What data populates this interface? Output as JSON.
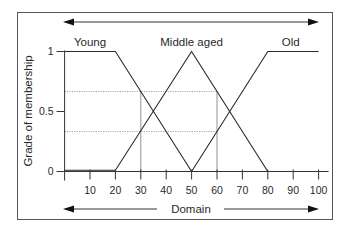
{
  "chart_data": {
    "type": "line",
    "title": "",
    "xlabel": "Domain",
    "ylabel": "Grade of membership",
    "xlim": [
      0,
      100
    ],
    "ylim": [
      0,
      1
    ],
    "grid": false,
    "legend": "inline labels above each membership function",
    "xticks": [
      10,
      20,
      30,
      40,
      50,
      60,
      70,
      80,
      90,
      100
    ],
    "xtick_labels": [
      "10",
      "20",
      "30",
      "40",
      "50",
      "60",
      "70",
      "80",
      "90",
      "100"
    ],
    "yticks": [
      0,
      0.5,
      1
    ],
    "ytick_labels": [
      "0",
      "0.5",
      "1"
    ],
    "series": [
      {
        "name": "Young",
        "x": [
          0,
          20,
          50
        ],
        "y": [
          1,
          1,
          0
        ],
        "label_at_x": 10
      },
      {
        "name": "Middle aged",
        "x": [
          0,
          20,
          50,
          80
        ],
        "y": [
          0,
          0,
          1,
          0
        ],
        "label_at_x": 50
      },
      {
        "name": "Old",
        "x": [
          50,
          80,
          100
        ],
        "y": [
          0,
          1,
          1
        ],
        "label_at_x": 89
      }
    ],
    "reference_lines": {
      "horizontal": [
        {
          "y": 0.667,
          "x_from": 0,
          "x_to": 60
        },
        {
          "y": 0.333,
          "x_from": 0,
          "x_to": 60
        }
      ],
      "vertical": [
        {
          "x": 30,
          "y_from": 0,
          "y_to": 0.667
        },
        {
          "x": 60,
          "y_from": 0,
          "y_to": 0.667
        }
      ]
    },
    "annotations": [
      {
        "type": "double-arrow",
        "position": "top",
        "meaning": "span of domain"
      },
      {
        "type": "double-arrow",
        "position": "bottom",
        "text": "Domain"
      }
    ],
    "colors": {
      "lines": "#2b2b2b",
      "reference": "#8a8a8a",
      "text": "#2a2a2a"
    }
  }
}
